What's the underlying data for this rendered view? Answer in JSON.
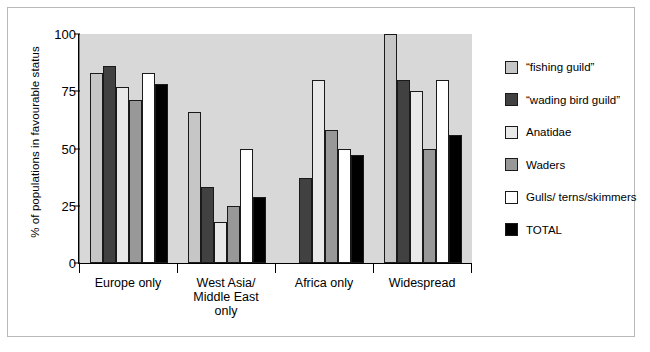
{
  "chart_data": {
    "type": "bar",
    "title": "",
    "xlabel": "",
    "ylabel": "% of populations in favourable status",
    "ylim": [
      0,
      100
    ],
    "yticks": [
      0,
      25,
      50,
      75,
      100
    ],
    "grid": false,
    "legend_position": "right",
    "categories": [
      "Europe only",
      "West Asia/ Middle East only",
      "Africa only",
      "Widespread"
    ],
    "series": [
      {
        "name": "“fishing guild”",
        "color": "#c6c6c6",
        "values": [
          83,
          66,
          null,
          100
        ]
      },
      {
        "name": "“wading bird guild”",
        "color": "#414141",
        "values": [
          86,
          33,
          37,
          80
        ]
      },
      {
        "name": "Anatidae",
        "color": "#e9e9e9",
        "values": [
          77,
          18,
          80,
          75
        ]
      },
      {
        "name": "Waders",
        "color": "#989898",
        "values": [
          71,
          25,
          58,
          50
        ]
      },
      {
        "name": "Gulls/ terns/skimmers",
        "color": "#ffffff",
        "values": [
          83,
          50,
          50,
          80
        ]
      },
      {
        "name": "TOTAL",
        "color": "#000000",
        "values": [
          78,
          29,
          47,
          56
        ]
      }
    ]
  },
  "axis": {
    "ytick_labels": [
      "100",
      "75",
      "50",
      "25",
      "0"
    ],
    "xtick_labels": [
      {
        "lines": [
          "Europe only"
        ]
      },
      {
        "lines": [
          "West Asia/",
          "Middle East",
          "only"
        ]
      },
      {
        "lines": [
          "Africa only"
        ]
      },
      {
        "lines": [
          "Widespread"
        ]
      }
    ]
  },
  "legend": {
    "items": [
      {
        "label": "“fishing guild”",
        "color": "#c6c6c6"
      },
      {
        "label": "“wading bird guild”",
        "color": "#414141"
      },
      {
        "label": "Anatidae",
        "color": "#e9e9e9"
      },
      {
        "label": "Waders",
        "color": "#989898"
      },
      {
        "label": "Gulls/ terns/skimmers",
        "color": "#ffffff"
      },
      {
        "label": "TOTAL",
        "color": "#000000"
      }
    ]
  },
  "colors": {
    "plot_background": "#d8d8d8",
    "figure_background": "#ffffff",
    "frame_border": "#b9b9b9",
    "axis": "#000000"
  }
}
